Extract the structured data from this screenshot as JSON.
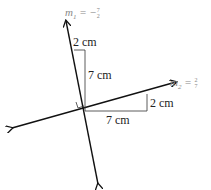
{
  "line1": {
    "slope_label": "m",
    "slope_subscript": "1",
    "slope_equals": " = −",
    "slope_num": "7",
    "slope_den": "2",
    "rise_label": "7 cm",
    "run_label": "2 cm"
  },
  "line2": {
    "slope_label": "m",
    "slope_subscript": "2",
    "slope_equals": " = ",
    "slope_num": "2",
    "slope_den": "7",
    "rise_label": "2 cm",
    "run_label": "7 cm"
  },
  "colors": {
    "line": "#111111",
    "triangle": "#333333",
    "slope_text": "#888888"
  }
}
